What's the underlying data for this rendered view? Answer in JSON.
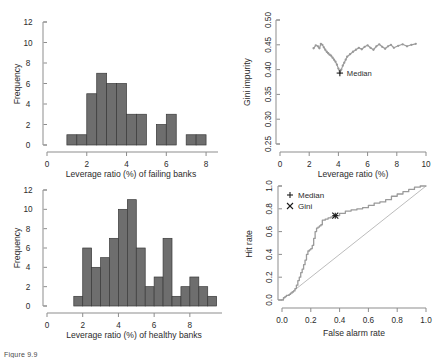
{
  "figure": {
    "caption": "Figure 9.9",
    "background": "#ffffff",
    "bar_fill": "#6e6e6e",
    "bar_stroke": "#3a3a3a",
    "curve_color": "#9a9a9a",
    "axis_color": "#8d8d8d"
  },
  "chart_data": [
    {
      "id": "failing-banks-histogram",
      "position": "top-left",
      "type": "bar",
      "title": "",
      "xlabel": "Leverage ratio (%) of failing banks",
      "ylabel": "Frequency",
      "xlim": [
        0,
        8.6
      ],
      "ylim": [
        0,
        12
      ],
      "xticks": [
        0,
        2,
        4,
        6,
        8
      ],
      "xticklabels": [
        "0",
        "2",
        "4",
        "6",
        "8"
      ],
      "yticks": [
        0,
        2,
        4,
        6,
        8,
        10,
        12
      ],
      "yticklabels": [
        "0",
        "2",
        "4",
        "6",
        "8",
        "10",
        "12"
      ],
      "bin_width": 0.5,
      "bin_starts": [
        1.0,
        1.5,
        2.0,
        2.5,
        3.0,
        3.5,
        4.0,
        4.5,
        5.0,
        5.5,
        6.0,
        6.5,
        7.0,
        7.5
      ],
      "values": [
        1,
        1,
        5,
        7,
        6,
        6,
        3,
        3,
        0,
        2,
        3,
        0,
        1,
        1
      ],
      "grid": false,
      "legend": null
    },
    {
      "id": "gini-impurity-scatter",
      "position": "top-right",
      "type": "scatter",
      "title": "",
      "xlabel": "Leverage ratio (%)",
      "ylabel": "Gini impurity",
      "xlim": [
        0,
        10
      ],
      "ylim": [
        0.25,
        0.5
      ],
      "xticks": [
        0,
        2,
        4,
        6,
        8,
        10
      ],
      "xticklabels": [
        "0",
        "2",
        "4",
        "6",
        "8",
        "10"
      ],
      "yticks": [
        0.25,
        0.3,
        0.35,
        0.4,
        0.45,
        0.5
      ],
      "yticklabels": [
        "0.25",
        "0.30",
        "0.35",
        "0.40",
        "0.45",
        "0.50"
      ],
      "grid": false,
      "annotations": [
        {
          "label": "Median",
          "marker": "plus",
          "x": 4.1,
          "y": 0.393
        }
      ],
      "x": [
        2.3,
        2.45,
        2.6,
        2.7,
        2.8,
        2.9,
        3.0,
        3.1,
        3.2,
        3.3,
        3.4,
        3.5,
        3.6,
        3.7,
        3.8,
        3.9,
        4.0,
        4.1,
        4.2,
        4.3,
        4.4,
        4.5,
        4.6,
        4.8,
        5.0,
        5.2,
        5.4,
        5.6,
        5.8,
        6.0,
        6.2,
        6.4,
        6.6,
        6.8,
        7.0,
        7.2,
        7.4,
        7.6,
        7.8,
        8.1,
        8.4,
        8.7,
        9.0,
        9.3
      ],
      "y": [
        0.443,
        0.449,
        0.447,
        0.443,
        0.452,
        0.45,
        0.445,
        0.44,
        0.436,
        0.433,
        0.43,
        0.428,
        0.424,
        0.42,
        0.416,
        0.41,
        0.402,
        0.393,
        0.4,
        0.408,
        0.414,
        0.42,
        0.426,
        0.431,
        0.436,
        0.44,
        0.444,
        0.441,
        0.446,
        0.449,
        0.444,
        0.44,
        0.447,
        0.451,
        0.446,
        0.442,
        0.447,
        0.45,
        0.444,
        0.448,
        0.451,
        0.447,
        0.45,
        0.452
      ]
    },
    {
      "id": "healthy-banks-histogram",
      "position": "bottom-left",
      "type": "bar",
      "title": "",
      "xlabel": "Leverage ratio (%) of healthy banks",
      "ylabel": "Frequency",
      "xlim": [
        0,
        9.8
      ],
      "ylim": [
        0,
        12
      ],
      "xticks": [
        0,
        2,
        4,
        6,
        8
      ],
      "xticklabels": [
        "0",
        "2",
        "4",
        "6",
        "8"
      ],
      "yticks": [
        0,
        2,
        4,
        6,
        8,
        10,
        12
      ],
      "yticklabels": [
        "0",
        "2",
        "4",
        "6",
        "8",
        "10",
        "12"
      ],
      "bin_width": 0.5,
      "bin_starts": [
        1.5,
        2.0,
        2.5,
        3.0,
        3.5,
        4.0,
        4.5,
        5.0,
        5.5,
        6.0,
        6.5,
        7.0,
        7.5,
        8.0,
        8.5,
        9.0
      ],
      "values": [
        1,
        6,
        4,
        5,
        7,
        10,
        11,
        6,
        2,
        3,
        7,
        1,
        2,
        3,
        2,
        1
      ],
      "grid": false,
      "legend": null
    },
    {
      "id": "roc-curve",
      "position": "bottom-right",
      "type": "line",
      "title": "",
      "xlabel": "False alarm rate",
      "ylabel": "Hit rate",
      "xlim": [
        0,
        1
      ],
      "ylim": [
        0,
        1
      ],
      "xticks": [
        0.0,
        0.2,
        0.4,
        0.6,
        0.8,
        1.0
      ],
      "xticklabels": [
        "0.0",
        "0.2",
        "0.4",
        "0.6",
        "0.8",
        "1.0"
      ],
      "yticks": [
        0.0,
        0.2,
        0.4,
        0.6,
        0.8,
        1.0
      ],
      "yticklabels": [
        "0.0",
        "0.2",
        "0.4",
        "0.6",
        "0.8",
        "1.0"
      ],
      "grid": false,
      "legend_position": "top-left",
      "legend": [
        {
          "label": "Median",
          "marker": "plus"
        },
        {
          "label": "Gini",
          "marker": "cross"
        }
      ],
      "annotations": [
        {
          "label": "Median",
          "marker": "plus",
          "x": 0.37,
          "y": 0.74
        },
        {
          "label": "Gini",
          "marker": "cross",
          "x": 0.37,
          "y": 0.74
        }
      ],
      "diagonal_reference": true,
      "x": [
        0.0,
        0.01,
        0.02,
        0.03,
        0.04,
        0.05,
        0.06,
        0.07,
        0.08,
        0.09,
        0.1,
        0.11,
        0.12,
        0.13,
        0.14,
        0.15,
        0.16,
        0.17,
        0.18,
        0.19,
        0.2,
        0.21,
        0.22,
        0.23,
        0.24,
        0.25,
        0.26,
        0.27,
        0.28,
        0.3,
        0.32,
        0.34,
        0.36,
        0.37,
        0.4,
        0.44,
        0.48,
        0.52,
        0.56,
        0.6,
        0.64,
        0.68,
        0.72,
        0.76,
        0.8,
        0.84,
        0.88,
        0.92,
        0.96,
        1.0
      ],
      "y": [
        0.0,
        0.02,
        0.03,
        0.04,
        0.04,
        0.05,
        0.06,
        0.07,
        0.08,
        0.1,
        0.13,
        0.17,
        0.2,
        0.24,
        0.27,
        0.31,
        0.35,
        0.4,
        0.43,
        0.44,
        0.45,
        0.48,
        0.54,
        0.6,
        0.63,
        0.64,
        0.65,
        0.66,
        0.7,
        0.71,
        0.72,
        0.73,
        0.74,
        0.74,
        0.76,
        0.78,
        0.79,
        0.8,
        0.81,
        0.83,
        0.85,
        0.86,
        0.88,
        0.91,
        0.93,
        0.95,
        0.97,
        0.99,
        1.0,
        1.0
      ]
    }
  ]
}
